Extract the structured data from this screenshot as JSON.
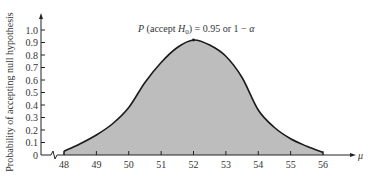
{
  "chart_data": {
    "type": "area",
    "title": "",
    "annotation": {
      "text_prefix": "P",
      "text_mid": " (accept H",
      "text_sub": "0",
      "text_suffix": ") = 0.95 or 1 − α",
      "x": 52,
      "y": 0.95
    },
    "xlabel": "μ",
    "ylabel": "Probability of accepting null hypothesis",
    "x_ticks": [
      "48",
      "49",
      "50",
      "51",
      "52",
      "53",
      "54",
      "55",
      "56"
    ],
    "y_ticks": [
      "0",
      "0.1",
      "0.2",
      "0.3",
      "0.4",
      "0.5",
      "0.6",
      "0.7",
      "0.8",
      "0.9",
      "1.0"
    ],
    "xlim": [
      48,
      56
    ],
    "ylim": [
      0,
      1.0
    ],
    "axis_break": true,
    "grid": false,
    "legend": null,
    "x": [
      48,
      48.5,
      49,
      49.5,
      50,
      50.5,
      51,
      51.5,
      52,
      52.5,
      53,
      53.5,
      54,
      54.5,
      55,
      55.5,
      56
    ],
    "values": [
      0.03,
      0.09,
      0.16,
      0.25,
      0.38,
      0.58,
      0.74,
      0.86,
      0.92,
      0.88,
      0.79,
      0.62,
      0.36,
      0.22,
      0.13,
      0.07,
      0.02
    ],
    "fill_color": "#bdbdbd",
    "line_color": "#1a1a1a"
  }
}
